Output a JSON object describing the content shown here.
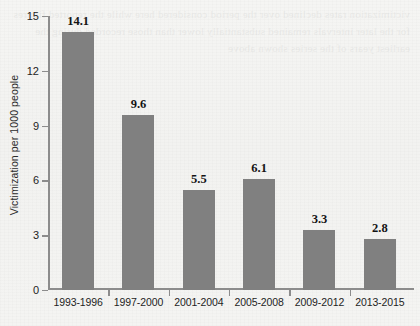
{
  "chart_data": {
    "type": "bar",
    "title": "",
    "subtitle": "",
    "xlabel": "",
    "ylabel": "Victimization per 1000 people",
    "categories": [
      "1993-1996",
      "1997-2000",
      "2001-2004",
      "2005-2008",
      "2009-2012",
      "2013-2015"
    ],
    "values": [
      14.1,
      9.6,
      5.5,
      6.1,
      3.3,
      2.8
    ],
    "value_labels": [
      "14.1",
      "9.6",
      "5.5",
      "6.1",
      "3.3",
      "2.8"
    ],
    "ylim": [
      0,
      15
    ],
    "yticks": [
      0,
      3,
      6,
      9,
      12,
      15
    ],
    "ytick_labels": [
      "0",
      "3",
      "6",
      "9",
      "12",
      "15"
    ],
    "grid": false,
    "legend": false,
    "bar_color": "#808080",
    "axis_color": "#8c8c8c",
    "text_color": "#1e1e1e",
    "background_color": "#f3f3f1"
  },
  "background_bleed_text": "victimization rates declined over the period considered here while the reported figures for the later intervals remained substantially lower than those recorded during the earliest years of the series shown above"
}
